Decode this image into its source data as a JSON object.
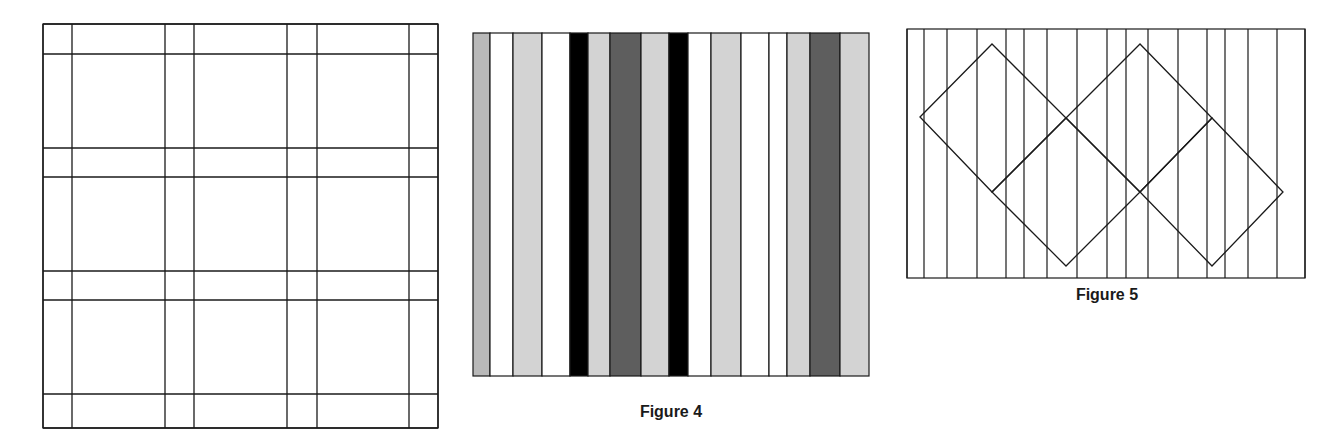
{
  "figures": [
    {
      "id": "fig3",
      "caption": "",
      "description": "Square plaid grid of paired horizontal and vertical lines",
      "frame": {
        "x": 43,
        "y": 24,
        "w": 395,
        "h": 404
      },
      "vertical_lines": [
        43,
        72,
        165,
        194,
        287,
        317,
        409,
        438
      ],
      "horizontal_lines": [
        24,
        54,
        148,
        177,
        271,
        300,
        394,
        428
      ],
      "stroke": "#1a1a1a"
    },
    {
      "id": "fig4",
      "caption": "Figure 4",
      "description": "Vertical stripes of varying widths and gray shades",
      "frame": {
        "x": 473,
        "y": 33,
        "w": 396,
        "h": 343
      },
      "stripes": [
        {
          "x0": 473,
          "x1": 490,
          "fill": "#b9b9b9"
        },
        {
          "x0": 490,
          "x1": 513,
          "fill": "#ffffff"
        },
        {
          "x0": 513,
          "x1": 542,
          "fill": "#d3d3d3"
        },
        {
          "x0": 542,
          "x1": 570,
          "fill": "#ffffff"
        },
        {
          "x0": 570,
          "x1": 588,
          "fill": "#000000"
        },
        {
          "x0": 588,
          "x1": 610,
          "fill": "#d3d3d3"
        },
        {
          "x0": 610,
          "x1": 641,
          "fill": "#5e5e5e"
        },
        {
          "x0": 641,
          "x1": 669,
          "fill": "#d3d3d3"
        },
        {
          "x0": 669,
          "x1": 688,
          "fill": "#000000"
        },
        {
          "x0": 688,
          "x1": 711,
          "fill": "#ffffff"
        },
        {
          "x0": 711,
          "x1": 741,
          "fill": "#d3d3d3"
        },
        {
          "x0": 741,
          "x1": 769,
          "fill": "#ffffff"
        },
        {
          "x0": 769,
          "x1": 787,
          "fill": "#ffffff"
        },
        {
          "x0": 787,
          "x1": 810,
          "fill": "#d3d3d3"
        },
        {
          "x0": 810,
          "x1": 840,
          "fill": "#5e5e5e"
        },
        {
          "x0": 840,
          "x1": 869,
          "fill": "#d3d3d3"
        }
      ],
      "stroke": "#1a1a1a"
    },
    {
      "id": "fig5",
      "caption": "Figure 5",
      "description": "Vertical lines with two overlapping rotated squares (diamonds) chain",
      "frame": {
        "x": 907,
        "y": 29,
        "w": 398,
        "h": 249
      },
      "vertical_lines": [
        907,
        924,
        947,
        977,
        1006,
        1024,
        1047,
        1077,
        1107,
        1126,
        1148,
        1178,
        1207,
        1225,
        1248,
        1277,
        1305
      ],
      "polygons": [
        [
          [
            920,
            117
          ],
          [
            992,
            44
          ],
          [
            1066,
            118
          ],
          [
            992,
            192
          ]
        ],
        [
          [
            1066,
            118
          ],
          [
            1140,
            44
          ],
          [
            1212,
            118
          ],
          [
            1140,
            192
          ]
        ],
        [
          [
            992,
            192
          ],
          [
            1066,
            118
          ],
          [
            1140,
            192
          ],
          [
            1066,
            266
          ]
        ],
        [
          [
            1140,
            192
          ],
          [
            1212,
            118
          ],
          [
            1283,
            192
          ],
          [
            1212,
            266
          ]
        ]
      ],
      "stroke": "#1a1a1a"
    }
  ]
}
